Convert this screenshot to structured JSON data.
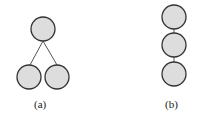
{
  "diagrams": [
    {
      "label": "(a)",
      "shape": "tree",
      "nodes": 3
    },
    {
      "label": "(b)",
      "shape": "chain",
      "nodes": 3
    }
  ],
  "colors": {
    "node_fill": "#dddddd",
    "stroke": "#333333"
  }
}
